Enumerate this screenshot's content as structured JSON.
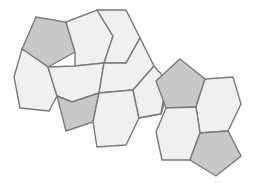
{
  "figure": {
    "width": 253,
    "height": 183,
    "background_color": "#ffffff"
  },
  "palette": {
    "hexagon_fill": "#f0f0f0",
    "pentagon_fill": "#c8c8c8",
    "stroke": "#7a7a7a",
    "stroke_light": "#9a9a9a",
    "stroke_width": 1.4,
    "background": "#ffffff"
  },
  "tiles": [
    {
      "id": "pentagon-top-left",
      "shape": "pentagon",
      "fill_key": "pentagon_fill",
      "points": "36,17 66,22 75,52 48,67 22,49"
    },
    {
      "id": "hexagon-upper-left-inner",
      "shape": "hexagon",
      "fill_key": "hexagon_fill",
      "points": "66,22 97,10 113,36 104,63 75,66 75,52"
    },
    {
      "id": "hexagon-top-right-upper",
      "shape": "hexagon",
      "fill_key": "hexagon_fill",
      "points": "97,10 126,10 140,38 126,63 104,63 113,36"
    },
    {
      "id": "hexagon-left-middle",
      "shape": "hexagon",
      "fill_key": "hexagon_fill",
      "points": "22,49 48,67 57,96 49,111 20,108 14,77"
    },
    {
      "id": "hexagon-center-left",
      "shape": "hexagon",
      "fill_key": "hexagon_fill",
      "points": "48,67 75,66 104,63 99,93 72,102 57,96"
    },
    {
      "id": "pentagon-center-left",
      "shape": "pentagon",
      "fill_key": "pentagon_fill",
      "points": "57,96 72,102 99,93 93,122 66,131"
    },
    {
      "id": "hexagon-center-upper",
      "shape": "hexagon",
      "fill_key": "hexagon_fill",
      "points": "104,63 126,63 140,38 154,66 133,90 99,93"
    },
    {
      "id": "hexagon-center-lower",
      "shape": "hexagon",
      "fill_key": "hexagon_fill",
      "points": "99,93 133,90 139,118 126,145 97,147 93,122"
    },
    {
      "id": "hexagon-mid-right",
      "shape": "hexagon",
      "fill_key": "hexagon_fill",
      "points": "133,90 154,66 170,84 161,114 139,118 139,118"
    },
    {
      "id": "hexagon-chain-right",
      "shape": "hexagon",
      "fill_key": "hexagon_fill",
      "points": "139,118 161,114 170,84 166,84 161,114"
    },
    {
      "id": "pentagon-right-upper",
      "shape": "pentagon",
      "fill_key": "pentagon_fill",
      "points": "180,59 205,79 196,107 166,108 156,81"
    },
    {
      "id": "hexagon-right-of-pentagon",
      "shape": "hexagon",
      "fill_key": "hexagon_fill",
      "points": "205,79 233,77 241,104 228,131 200,133 196,107"
    },
    {
      "id": "hexagon-below-pentagon-right",
      "shape": "hexagon",
      "fill_key": "hexagon_fill",
      "points": "166,108 196,107 200,133 190,160 162,160 156,132"
    },
    {
      "id": "pentagon-bottom-right",
      "shape": "pentagon",
      "fill_key": "pentagon_fill",
      "points": "200,133 228,131 241,156 216,176 190,160"
    }
  ]
}
